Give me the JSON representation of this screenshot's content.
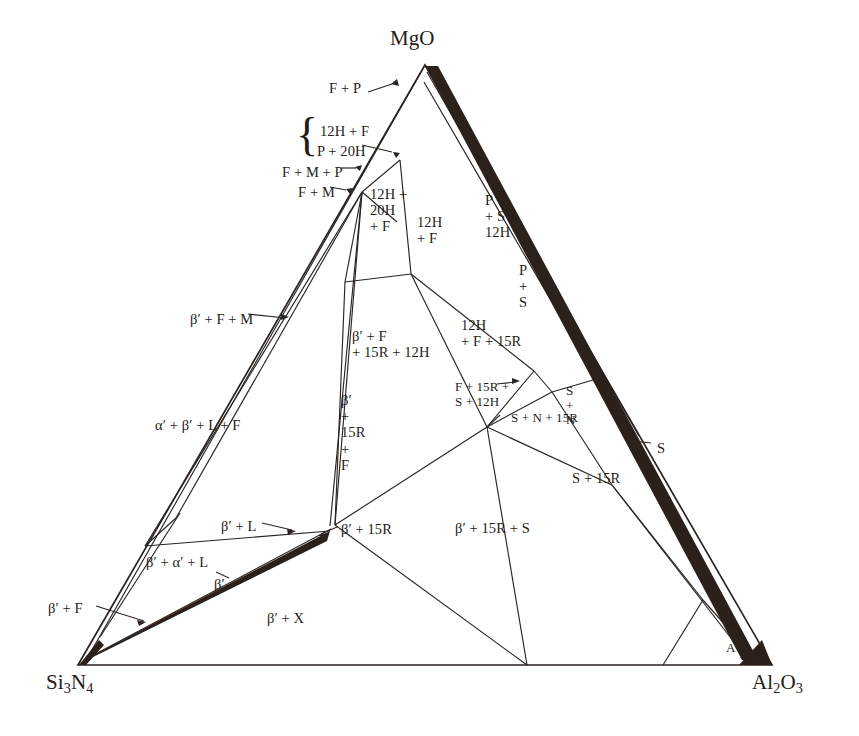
{
  "figure": {
    "type": "ternary-phase-diagram",
    "system": "Si3N4 - MgO - Al2O3",
    "corners": [
      {
        "id": "mgo",
        "label": "MgO",
        "x": 425,
        "y": 48
      },
      {
        "id": "si3n4",
        "label_main": "Si",
        "label_sub1": "3",
        "label_mid": "N",
        "label_sub2": "4",
        "x": 78,
        "y": 688
      },
      {
        "id": "al2o3",
        "label_main": "Al",
        "label_sub1": "2",
        "label_mid": "O",
        "label_sub2": "3",
        "x": 772,
        "y": 688
      }
    ],
    "colors": {
      "line": "#2b2420",
      "fill_band": "#2c211a",
      "background": "#ffffff",
      "text": "#241c17"
    },
    "regions": [
      {
        "id": "f-p",
        "text": "F + P",
        "x": 329,
        "y": 80,
        "align": "left"
      },
      {
        "id": "12h-f",
        "text": "12H + F",
        "x": 320,
        "y": 123,
        "align": "left"
      },
      {
        "id": "p-20h",
        "text": "P + 20H",
        "x": 317,
        "y": 143,
        "align": "left"
      },
      {
        "id": "f-m-p",
        "text": "F + M + P",
        "x": 282,
        "y": 164,
        "align": "left"
      },
      {
        "id": "f-m",
        "text": "F + M",
        "x": 298,
        "y": 184,
        "align": "left"
      },
      {
        "id": "12h-20h-f",
        "text": "12H +\n20H\n+ F",
        "x": 370,
        "y": 186,
        "align": "left"
      },
      {
        "id": "12h-f-2",
        "text": "12H\n+ F",
        "x": 417,
        "y": 214,
        "align": "left"
      },
      {
        "id": "p-s-12h",
        "text": "P\n+ S +\n12H",
        "x": 485,
        "y": 192,
        "align": "left"
      },
      {
        "id": "p-s",
        "text": "P\n+\nS",
        "x": 519,
        "y": 262,
        "align": "left"
      },
      {
        "id": "bp-f-m",
        "text": "β′ + F + M",
        "x": 190,
        "y": 311,
        "align": "left"
      },
      {
        "id": "bp-f-15r-12h",
        "text": "β′ + F\n+ 15R + 12H",
        "x": 352,
        "y": 328,
        "align": "left"
      },
      {
        "id": "12h-f-15r",
        "text": "12H\n+ F + 15R",
        "x": 461,
        "y": 317,
        "align": "left"
      },
      {
        "id": "ap-bp-l-f",
        "text": "α′ + β′ + L + F",
        "x": 155,
        "y": 417,
        "align": "left"
      },
      {
        "id": "bp-15r-f",
        "text": "β′\n+\n15R\n+\nF",
        "x": 341,
        "y": 392,
        "align": "left"
      },
      {
        "id": "f-15r-s-12h",
        "text": "F + 15R +\nS + 12H",
        "x": 455,
        "y": 380,
        "align": "left"
      },
      {
        "id": "s-n",
        "text": "S\n+\nN",
        "x": 566,
        "y": 384,
        "align": "left"
      },
      {
        "id": "s-n-15r",
        "text": "S + N + 15R",
        "x": 511,
        "y": 411,
        "align": "left"
      },
      {
        "id": "s-leader",
        "text": "S",
        "x": 657,
        "y": 440,
        "align": "left"
      },
      {
        "id": "s-15r",
        "text": "S + 15R",
        "x": 572,
        "y": 470,
        "align": "left"
      },
      {
        "id": "bp-l",
        "text": "β′ + L",
        "x": 221,
        "y": 518,
        "align": "left"
      },
      {
        "id": "bp-15r",
        "text": "β′ + 15R",
        "x": 341,
        "y": 521,
        "align": "left"
      },
      {
        "id": "bp-15r-s",
        "text": "β′ + 15R + S",
        "x": 455,
        "y": 520,
        "align": "left"
      },
      {
        "id": "bp-ap-l",
        "text": "β′ + α′ + L",
        "x": 146,
        "y": 554,
        "align": "left"
      },
      {
        "id": "bp-prime",
        "text": "β′",
        "x": 214,
        "y": 576,
        "align": "left"
      },
      {
        "id": "bp-x",
        "text": "β′ + X",
        "x": 267,
        "y": 610,
        "align": "left"
      },
      {
        "id": "bp-f",
        "text": "β′ + F",
        "x": 48,
        "y": 600,
        "align": "left"
      },
      {
        "id": "s-corner",
        "text": "S",
        "x": 726,
        "y": 616,
        "align": "left"
      },
      {
        "id": "a-corner",
        "text": "A",
        "x": 726,
        "y": 641,
        "align": "left"
      }
    ],
    "brace": {
      "x": 298,
      "y": 118,
      "height": 46,
      "glyph": "{"
    }
  }
}
